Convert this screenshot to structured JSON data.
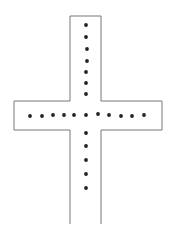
{
  "diagram": {
    "type": "cross-outline-with-dots",
    "stroke_color": "#777777",
    "dot_color": "#222222",
    "outline_points": "70,16 101,16 101,101 162,101 162,130 101,130 101,224 M70,224 70,130 14,130 14,101 70,101 70,16",
    "vertical_dots": [
      {
        "x": 86,
        "y": 25
      },
      {
        "x": 86,
        "y": 37
      },
      {
        "x": 87,
        "y": 49
      },
      {
        "x": 87,
        "y": 61
      },
      {
        "x": 86,
        "y": 72
      },
      {
        "x": 86,
        "y": 83
      },
      {
        "x": 86,
        "y": 94
      },
      {
        "x": 86,
        "y": 133
      },
      {
        "x": 86,
        "y": 146
      },
      {
        "x": 86,
        "y": 160
      },
      {
        "x": 86,
        "y": 174
      },
      {
        "x": 86,
        "y": 188
      }
    ],
    "horizontal_dots": [
      {
        "x": 30,
        "y": 116
      },
      {
        "x": 42,
        "y": 116
      },
      {
        "x": 53,
        "y": 115
      },
      {
        "x": 64,
        "y": 115
      },
      {
        "x": 74,
        "y": 115
      },
      {
        "x": 86,
        "y": 115
      },
      {
        "x": 98,
        "y": 114
      },
      {
        "x": 109,
        "y": 115
      },
      {
        "x": 121,
        "y": 116
      },
      {
        "x": 132,
        "y": 116
      },
      {
        "x": 144,
        "y": 115
      }
    ]
  }
}
